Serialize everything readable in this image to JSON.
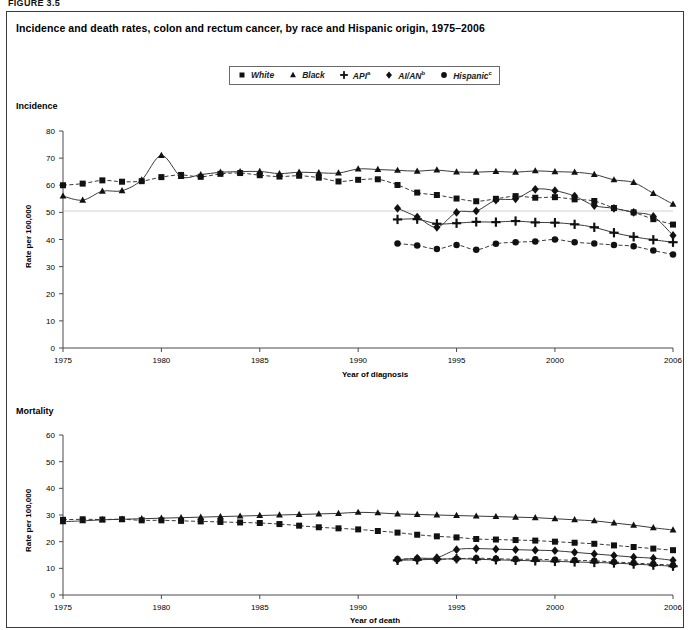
{
  "figure_label": "FIGURE 3.5",
  "title": "Incidence and death rates, colon and rectum cancer, by race  and Hispanic origin, 1975–2006",
  "legend": {
    "items": [
      {
        "label": "White",
        "sup": "",
        "marker": "square",
        "name": "legend-item-white"
      },
      {
        "label": "Black",
        "sup": "",
        "marker": "triangle",
        "name": "legend-item-black"
      },
      {
        "label": "API",
        "sup": "a",
        "marker": "plus",
        "name": "legend-item-api"
      },
      {
        "label": "AI/AN",
        "sup": "b",
        "marker": "diamond",
        "name": "legend-item-aian"
      },
      {
        "label": "Hispanic",
        "sup": "c",
        "marker": "circle",
        "name": "legend-item-hispanic"
      }
    ]
  },
  "panels": {
    "incidence": {
      "heading": "Incidence",
      "ylabel": "Rate per 100,000",
      "xlabel": "Year of diagnosis"
    },
    "mortality": {
      "heading": "Mortality",
      "ylabel": "Rate per 100,000",
      "xlabel": "Year of death"
    }
  },
  "chart_data": [
    {
      "type": "line",
      "id": "incidence",
      "title": "Incidence",
      "xlabel": "Year of diagnosis",
      "ylabel": "Rate per 100,000",
      "xlim": [
        1975,
        2006
      ],
      "ylim": [
        0,
        80
      ],
      "yticks": [
        0,
        10,
        20,
        30,
        40,
        50,
        60,
        70,
        80
      ],
      "xticks": [
        1975,
        1980,
        1985,
        1990,
        1995,
        2000,
        2006
      ],
      "grid": false,
      "legend_position": "top-center",
      "x": [
        1975,
        1976,
        1977,
        1978,
        1979,
        1980,
        1981,
        1982,
        1983,
        1984,
        1985,
        1986,
        1987,
        1988,
        1989,
        1990,
        1991,
        1992,
        1993,
        1994,
        1995,
        1996,
        1997,
        1998,
        1999,
        2000,
        2001,
        2002,
        2003,
        2004,
        2005,
        2006
      ],
      "series": [
        {
          "name": "White",
          "marker": "square",
          "dash": "dashed",
          "values": [
            60.0,
            60.6,
            61.8,
            61.3,
            61.5,
            63.0,
            63.8,
            63.1,
            64.2,
            64.5,
            63.7,
            63.2,
            63.5,
            62.8,
            61.4,
            62.0,
            62.2,
            60.1,
            57.3,
            56.4,
            55.1,
            54.1,
            55.0,
            56.0,
            55.4,
            55.6,
            54.8,
            54.2,
            51.6,
            50.0,
            47.5,
            45.5
          ]
        },
        {
          "name": "Black",
          "marker": "triangle",
          "dash": "solid",
          "values": [
            56.0,
            54.5,
            57.8,
            58.0,
            62.0,
            71.0,
            63.2,
            63.9,
            64.8,
            65.0,
            65.1,
            64.3,
            64.8,
            64.6,
            64.5,
            66.0,
            65.8,
            65.5,
            65.2,
            65.6,
            64.9,
            64.8,
            65.1,
            64.8,
            65.3,
            65.0,
            64.8,
            64.0,
            62.0,
            61.0,
            57.0,
            53.0
          ]
        },
        {
          "name": "API",
          "marker": "plus",
          "dash": "solid",
          "values": [
            null,
            null,
            null,
            null,
            null,
            null,
            null,
            null,
            null,
            null,
            null,
            null,
            null,
            null,
            null,
            null,
            null,
            47.4,
            47.5,
            45.8,
            46.0,
            46.5,
            46.4,
            46.8,
            46.3,
            46.2,
            45.6,
            44.5,
            42.5,
            41.0,
            39.9,
            39.0
          ]
        },
        {
          "name": "AI/AN",
          "marker": "diamond",
          "dash": "solid",
          "values": [
            null,
            null,
            null,
            null,
            null,
            null,
            null,
            null,
            null,
            null,
            null,
            null,
            null,
            null,
            null,
            null,
            null,
            51.5,
            48.3,
            44.5,
            50.0,
            50.5,
            54.5,
            55.0,
            58.5,
            58.0,
            56.0,
            52.5,
            51.5,
            50.0,
            48.5,
            41.5
          ]
        },
        {
          "name": "Hispanic",
          "marker": "circle",
          "dash": "dashed",
          "values": [
            null,
            null,
            null,
            null,
            null,
            null,
            null,
            null,
            null,
            null,
            null,
            null,
            null,
            null,
            null,
            null,
            null,
            38.5,
            37.8,
            36.5,
            38.0,
            36.2,
            38.4,
            39.0,
            39.3,
            40.0,
            39.0,
            38.5,
            38.0,
            37.5,
            35.9,
            34.5
          ]
        }
      ]
    },
    {
      "type": "line",
      "id": "mortality",
      "title": "Mortality",
      "xlabel": "Year of death",
      "ylabel": "Rate per 100,000",
      "xlim": [
        1975,
        2006
      ],
      "ylim": [
        0,
        60
      ],
      "yticks": [
        0,
        10,
        20,
        30,
        40,
        50,
        60
      ],
      "xticks": [
        1975,
        1980,
        1985,
        1990,
        1995,
        2000,
        2006
      ],
      "grid": false,
      "legend_position": "top-center",
      "x": [
        1975,
        1976,
        1977,
        1978,
        1979,
        1980,
        1981,
        1982,
        1983,
        1984,
        1985,
        1986,
        1987,
        1988,
        1989,
        1990,
        1991,
        1992,
        1993,
        1994,
        1995,
        1996,
        1997,
        1998,
        1999,
        2000,
        2001,
        2002,
        2003,
        2004,
        2005,
        2006
      ],
      "series": [
        {
          "name": "White",
          "marker": "square",
          "dash": "dashed",
          "values": [
            28.2,
            28.4,
            28.3,
            28.4,
            28.0,
            28.0,
            27.8,
            27.6,
            27.4,
            27.2,
            27.0,
            26.6,
            26.0,
            25.4,
            25.0,
            24.6,
            24.0,
            23.4,
            22.6,
            22.0,
            21.6,
            21.0,
            20.8,
            20.6,
            20.4,
            20.0,
            19.6,
            19.2,
            18.6,
            18.0,
            17.4,
            16.8
          ]
        },
        {
          "name": "Black",
          "marker": "triangle",
          "dash": "solid",
          "values": [
            27.5,
            27.8,
            28.2,
            28.4,
            28.6,
            28.8,
            29.0,
            29.2,
            29.4,
            29.6,
            29.8,
            30.0,
            30.2,
            30.4,
            30.6,
            31.0,
            30.8,
            30.4,
            30.2,
            30.0,
            29.8,
            29.6,
            29.4,
            29.2,
            29.0,
            28.6,
            28.2,
            27.8,
            27.0,
            26.2,
            25.2,
            24.4
          ]
        },
        {
          "name": "API",
          "marker": "plus",
          "dash": "solid",
          "values": [
            null,
            null,
            null,
            null,
            null,
            null,
            null,
            null,
            null,
            null,
            null,
            null,
            null,
            null,
            null,
            null,
            null,
            13.0,
            13.2,
            13.4,
            13.6,
            13.4,
            13.2,
            13.0,
            12.8,
            12.6,
            12.4,
            12.2,
            12.0,
            11.6,
            11.2,
            10.8
          ]
        },
        {
          "name": "AI/AN",
          "marker": "diamond",
          "dash": "solid",
          "values": [
            null,
            null,
            null,
            null,
            null,
            null,
            null,
            null,
            null,
            null,
            null,
            null,
            null,
            null,
            null,
            null,
            null,
            13.2,
            13.8,
            14.0,
            17.0,
            17.4,
            17.2,
            17.0,
            16.8,
            16.6,
            16.0,
            15.4,
            14.8,
            14.2,
            13.8,
            13.0
          ]
        },
        {
          "name": "Hispanic",
          "marker": "circle",
          "dash": "dashed",
          "values": [
            null,
            null,
            null,
            null,
            null,
            null,
            null,
            null,
            null,
            null,
            null,
            null,
            null,
            null,
            null,
            null,
            null,
            13.4,
            13.6,
            13.4,
            13.6,
            13.8,
            13.6,
            13.4,
            13.4,
            13.2,
            13.0,
            12.8,
            12.4,
            12.0,
            11.6,
            11.2
          ]
        }
      ]
    }
  ]
}
